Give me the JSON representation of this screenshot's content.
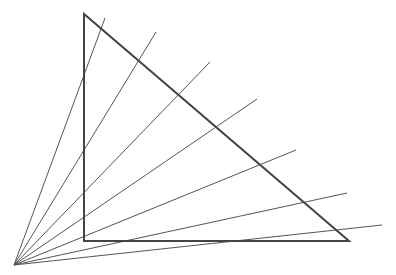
{
  "diagram": {
    "width": 396,
    "height": 275,
    "colors": {
      "background": "#ffffff",
      "triangle": "#444444",
      "rays": "#555555"
    },
    "triangle": {
      "points": [
        [
          84,
          14
        ],
        [
          84,
          241
        ],
        [
          349,
          241
        ]
      ],
      "stroke_width": 2
    },
    "origin": [
      14,
      265
    ],
    "rays": [
      {
        "end": [
          105,
          18
        ]
      },
      {
        "end": [
          156,
          32
        ]
      },
      {
        "end": [
          210,
          62
        ]
      },
      {
        "end": [
          257,
          99
        ]
      },
      {
        "end": [
          296,
          150
        ]
      },
      {
        "end": [
          347,
          193
        ]
      },
      {
        "end": [
          382,
          225
        ]
      }
    ]
  }
}
